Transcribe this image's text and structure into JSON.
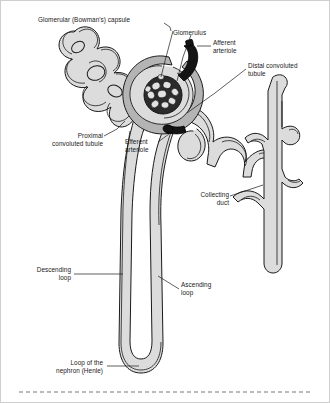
{
  "figure": {
    "type": "anatomical-line-diagram",
    "background_color": "#ffffff",
    "outline_color": "#1a1a1a",
    "tubule_fill_color": "#dcdcdc",
    "capsule_fill_color": "#b4b4b4",
    "glomerulus_fill_color": "#2b2b2b",
    "arteriole_fill_color": "#141414"
  },
  "labels": {
    "bowmans_capsule": "Glomerular (Bowman's) capsule",
    "glomerulus": "Glomerulus",
    "afferent_arteriole": "Afferent\narteriole",
    "distal_convoluted_tubule": "Distal convoluted\ntubule",
    "proximal_convoluted_tubule": "Proximal\nconvoluted tubule",
    "efferent_arteriole": "Efferent\narteriole",
    "collecting_duct": "Collecting\nduct",
    "descending_loop": "Descending\nloop",
    "ascending_loop": "Ascending\nloop",
    "loop_of_henle": "Loop of the\nnephron (Henle)"
  },
  "parts": [
    {
      "name": "glomerular-bowmans-capsule",
      "label": "Glomerular (Bowman's) capsule"
    },
    {
      "name": "glomerulus",
      "label": "Glomerulus"
    },
    {
      "name": "afferent-arteriole",
      "label": "Afferent arteriole"
    },
    {
      "name": "distal-convoluted-tubule",
      "label": "Distal convoluted tubule"
    },
    {
      "name": "proximal-convoluted-tubule",
      "label": "Proximal convoluted tubule"
    },
    {
      "name": "efferent-arteriole",
      "label": "Efferent arteriole"
    },
    {
      "name": "collecting-duct",
      "label": "Collecting duct"
    },
    {
      "name": "descending-loop",
      "label": "Descending loop"
    },
    {
      "name": "ascending-loop",
      "label": "Ascending loop"
    },
    {
      "name": "loop-of-the-nephron-henle",
      "label": "Loop of the nephron (Henle)"
    }
  ]
}
